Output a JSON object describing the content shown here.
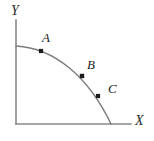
{
  "figure": {
    "width": 154,
    "height": 141,
    "background_color": "#ffffff"
  },
  "chart_data": {
    "type": "line",
    "title": "",
    "subtitle": "",
    "xlabel": "X",
    "ylabel": "Y",
    "grid": false,
    "legend": null,
    "axis_color": "#8a8a8a",
    "curve_color": "#7d7d7d",
    "point_color": "#1c1c1c",
    "xlim": [
      0,
      1
    ],
    "ylim": [
      0,
      1
    ],
    "axis_origin_px": [
      16,
      124
    ],
    "x_axis_end_px": [
      131,
      124
    ],
    "y_axis_end_px": [
      16,
      20
    ],
    "curve_description": "concave quarter-arc (production possibilities frontier) from the Y axis intercept down to the X axis intercept",
    "curve_endpoints_px": [
      [
        16,
        46
      ],
      [
        111,
        124
      ]
    ],
    "curve_path": "M 16 46 C 54 48 88 76 111 124",
    "series": [
      {
        "name": "Production possibilities frontier",
        "x": [
          0.0,
          0.26,
          0.69,
          0.86,
          1.0
        ],
        "y": [
          1.0,
          0.94,
          0.62,
          0.36,
          0.0
        ]
      }
    ],
    "points": [
      {
        "label": "A",
        "x_px": 41,
        "y_px": 51,
        "x": 0.26,
        "y": 0.94,
        "label_x_px": 42,
        "label_y_px": 31
      },
      {
        "label": "B",
        "x_px": 82,
        "y_px": 76,
        "x": 0.69,
        "y": 0.62,
        "label_x_px": 87,
        "label_y_px": 58
      },
      {
        "label": "C",
        "x_px": 98,
        "y_px": 96,
        "x": 0.86,
        "y": 0.36,
        "label_x_px": 108,
        "label_y_px": 82
      }
    ],
    "annotations": [
      "A",
      "B",
      "C"
    ],
    "tick_labels": {
      "x": [],
      "y": []
    }
  },
  "labels": {
    "y_axis": "Y",
    "x_axis": "X",
    "point_a": "A",
    "point_b": "B",
    "point_c": "C"
  }
}
